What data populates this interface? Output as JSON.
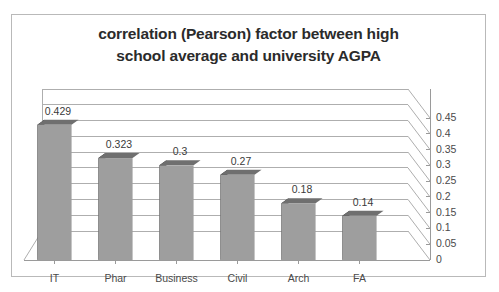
{
  "chart_data": {
    "type": "bar",
    "title": "correlation (Pearson) factor between high school average and university AGPA",
    "title_lines": [
      "correlation (Pearson) factor between high",
      "school average and university AGPA"
    ],
    "categories": [
      "IT",
      "Phar",
      "Business",
      "Civil",
      "Arch",
      "FA"
    ],
    "values": [
      0.429,
      0.323,
      0.3,
      0.27,
      0.18,
      0.14
    ],
    "value_labels": [
      "0.429",
      "0.323",
      "0.3",
      "0.27",
      "0.18",
      "0.14"
    ],
    "xlabel": "",
    "ylabel": "",
    "ylim": [
      0,
      0.45
    ],
    "ytick_step": 0.05,
    "ytick_labels": [
      "0",
      "0.05",
      "0.1",
      "0.15",
      "0.2",
      "0.25",
      "0.3",
      "0.35",
      "0.4",
      "0.45"
    ],
    "ytick_values": [
      0,
      0.05,
      0.1,
      0.15,
      0.2,
      0.25,
      0.3,
      0.35,
      0.4,
      0.45
    ],
    "grid": true,
    "gridlines": "horizontal",
    "legend": "none",
    "value_axis_position": "right",
    "render_style": "3d-column",
    "series": [
      {
        "name": "correlation factor",
        "values": [
          0.429,
          0.323,
          0.3,
          0.27,
          0.18,
          0.14
        ]
      }
    ]
  },
  "colors": {
    "bar_front": "#9e9e9e",
    "bar_side": "#1c1c1c",
    "bar_top": "#6f6f6f",
    "gridline": "#aeaeae",
    "axis_line": "#9a9a9a",
    "frame_border": "#b9b9b9",
    "title_text": "#2b2b2b",
    "label_text": "#4a4a4a",
    "background": "#ffffff"
  }
}
